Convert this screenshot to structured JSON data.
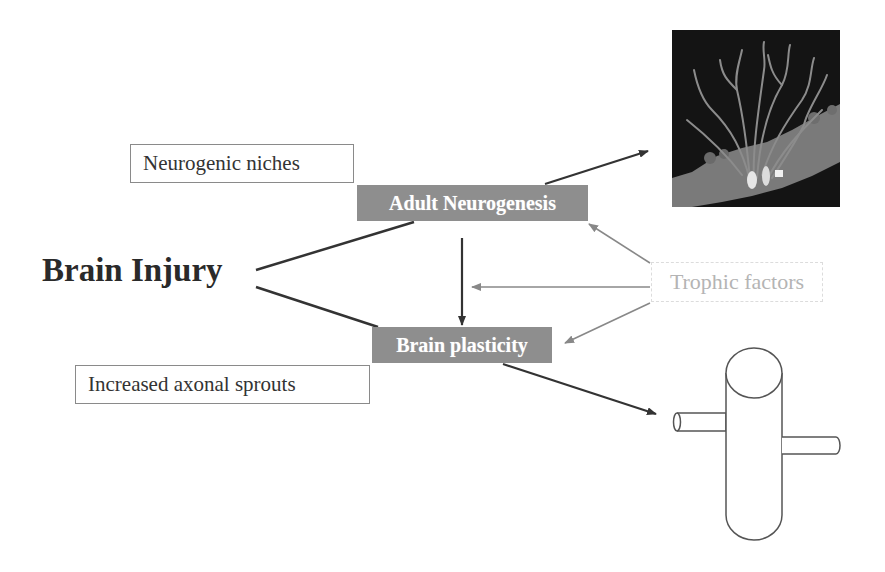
{
  "diagram": {
    "main_node": {
      "label": "Brain Injury"
    },
    "nodes": {
      "adult_neurogenesis": {
        "label": "Adult Neurogenesis"
      },
      "brain_plasticity": {
        "label": "Brain plasticity"
      },
      "neurogenic_niches": {
        "label": "Neurogenic niches"
      },
      "axonal_sprouts": {
        "label": "Increased axonal sprouts"
      },
      "trophic_factors": {
        "label": "Trophic factors"
      }
    },
    "images": {
      "neurons_micrograph": {
        "description": "fluorescence micrograph of neurons with dendrites"
      },
      "axon_schematic": {
        "description": "schematic cylinder with axonal sprouts"
      }
    },
    "edges": [
      {
        "from": "Brain Injury",
        "to": "Adult Neurogenesis",
        "type": "line"
      },
      {
        "from": "Brain Injury",
        "to": "Brain plasticity",
        "type": "line"
      },
      {
        "from": "Adult Neurogenesis",
        "to": "Brain plasticity",
        "type": "arrow"
      },
      {
        "from": "Adult Neurogenesis",
        "to": "neurons_micrograph",
        "type": "arrow"
      },
      {
        "from": "Brain plasticity",
        "to": "axon_schematic",
        "type": "arrow"
      },
      {
        "from": "Trophic factors",
        "to": "Adult Neurogenesis",
        "type": "arrow"
      },
      {
        "from": "Trophic factors",
        "to": "Adult Neurogenesis-to-Brain plasticity",
        "type": "arrow"
      },
      {
        "from": "Trophic factors",
        "to": "Brain plasticity",
        "type": "arrow"
      }
    ],
    "colors": {
      "gray_box": "#8e8e8e",
      "dark_line": "#333333",
      "trophic_line": "#8a8a8a",
      "trophic_text": "#b4b4b4"
    }
  }
}
